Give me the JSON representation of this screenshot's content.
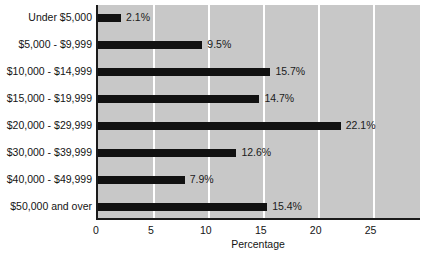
{
  "chart_data": {
    "type": "bar",
    "orientation": "horizontal",
    "title": "",
    "subtitle": "",
    "xlabel": "Percentage",
    "ylabel": "",
    "categories": [
      "Under $5,000",
      "$5,000 - $9,999",
      "$10,000 - $14,999",
      "$15,000 - $19,999",
      "$20,000 - $29,999",
      "$30,000 - $39,999",
      "$40,000 - $49,999",
      "$50,000 and over"
    ],
    "values": [
      2.1,
      9.5,
      15.7,
      14.7,
      22.1,
      12.6,
      7.9,
      15.4
    ],
    "data_labels": [
      "2.1%",
      "9.5%",
      "15.7%",
      "14.7%",
      "22.1%",
      "12.6%",
      "7.9%",
      "15.4%"
    ],
    "xlim": [
      0,
      29.5
    ],
    "xticks": [
      0,
      5,
      10,
      15,
      20,
      25
    ],
    "xtick_labels": [
      "0",
      "5",
      "10",
      "15",
      "20",
      "25"
    ],
    "grid": "vertical-white",
    "legend": "none",
    "colors": {
      "bar": "#111111",
      "plot_background": "#c8c8c8",
      "gridline": "#ffffff",
      "axis": "#1a1a1a",
      "text": "#141414",
      "page_background": "#ffffff"
    }
  }
}
